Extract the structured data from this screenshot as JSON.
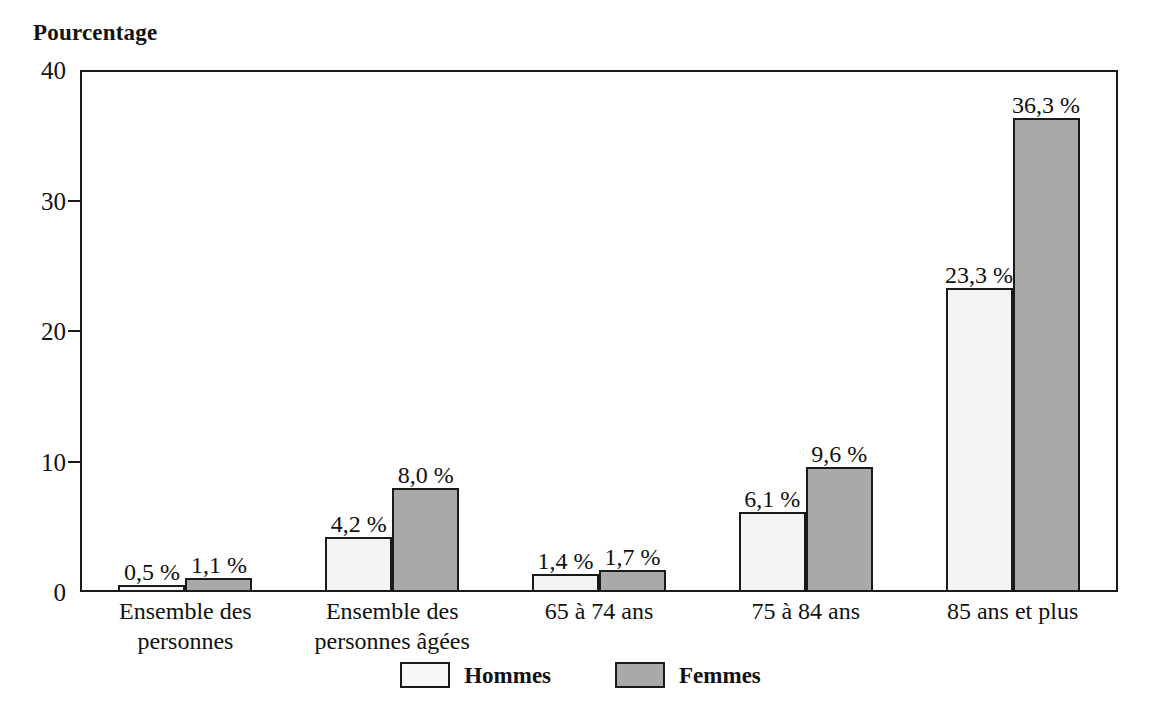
{
  "chart_data": {
    "type": "bar",
    "title": "Pourcentage",
    "xlabel": "",
    "ylabel": "Pourcentage",
    "ylim": [
      0,
      40
    ],
    "yticks": [
      0,
      10,
      20,
      30,
      40
    ],
    "ytick_labels": [
      "0",
      "10",
      "20",
      "30",
      "40"
    ],
    "grid": false,
    "legend_position": "bottom-center",
    "categories": [
      "Ensemble des personnes",
      "Ensemble des personnes âgées",
      "65 à 74 ans",
      "75 à 84 ans",
      "85 ans et plus"
    ],
    "category_lines": [
      [
        "Ensemble des",
        "personnes"
      ],
      [
        "Ensemble des",
        "personnes âgées"
      ],
      [
        "65 à 74 ans"
      ],
      [
        "75 à 84 ans"
      ],
      [
        "85 ans et plus"
      ]
    ],
    "series": [
      {
        "name": "Hommes",
        "color": "#f4f4f4",
        "values": [
          0.5,
          4.2,
          1.4,
          6.1,
          23.3
        ],
        "labels": [
          "0,5 %",
          "4,2 %",
          "1,4 %",
          "6,1 %",
          "23,3 %"
        ]
      },
      {
        "name": "Femmes",
        "color": "#a9a9a9",
        "values": [
          1.1,
          8.0,
          1.7,
          9.6,
          36.3
        ],
        "labels": [
          "1,1 %",
          "8,0 %",
          "1,7 %",
          "9,6 %",
          "36,3 %"
        ]
      }
    ]
  },
  "title": {
    "text": "Pourcentage"
  },
  "axis": {
    "y_ticks": [
      {
        "label": "40",
        "value": 40
      },
      {
        "label": "30",
        "value": 30
      },
      {
        "label": "20",
        "value": 20
      },
      {
        "label": "10",
        "value": 10
      },
      {
        "label": "0",
        "value": 0
      }
    ]
  },
  "legend": {
    "items": [
      {
        "label": "Hommes",
        "series": "hommes"
      },
      {
        "label": "Femmes",
        "series": "femmes"
      }
    ]
  },
  "colors": {
    "hommes": "#f4f4f4",
    "femmes": "#a9a9a9",
    "outline": "#1a1a1a",
    "background": "#ffffff"
  }
}
